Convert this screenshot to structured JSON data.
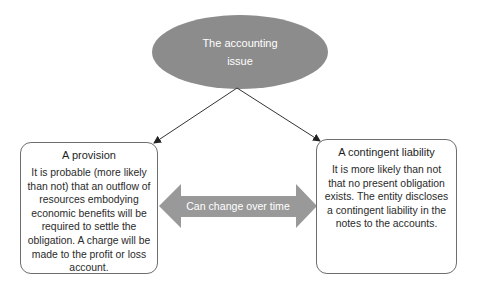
{
  "diagram": {
    "root": {
      "line1": "The accounting",
      "line2": "issue",
      "fill_color": "#8c8c8c"
    },
    "left_box": {
      "title": "A provision",
      "body": "It is probable (more likely than not) that an outflow of resources embodying economic benefits will be required to settle the obligation. A charge will be made to the profit or loss account."
    },
    "right_box": {
      "title": "A contingent liability",
      "body": "It is more likely than not that no present obligation exists. The entity discloses a contingent liability in the notes to the accounts."
    },
    "double_arrow": {
      "label": "Can change over time",
      "fill_color": "#999999"
    },
    "connector_color": "#333333",
    "border_color": "#6e6e6e"
  }
}
